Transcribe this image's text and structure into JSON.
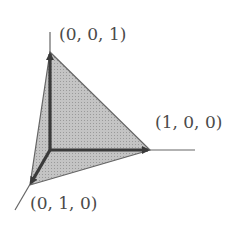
{
  "diagram": {
    "type": "3d-simplex",
    "labels": {
      "z_vertex": "(0, 0, 1)",
      "x_vertex": "(1, 0, 0)",
      "y_vertex": "(0, 1, 0)"
    },
    "colors": {
      "fill": "#bdbdbd",
      "edge": "#555555",
      "axis": "#3a3a3a"
    }
  }
}
